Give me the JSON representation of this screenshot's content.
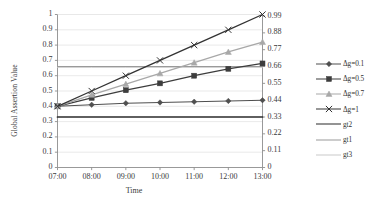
{
  "chart_data": {
    "type": "line",
    "title": "",
    "xlabel": "Time",
    "ylabel": "Global Assertion Value",
    "x": [
      "07:00",
      "08:00",
      "09:00",
      "10:00",
      "11:00",
      "12:00",
      "13:00"
    ],
    "xtick_labels": [
      "07:00",
      "08:00",
      "09:00",
      "10:00",
      "11:00",
      "12:00",
      "13:00"
    ],
    "ylim": [
      0,
      1
    ],
    "ytick_labels": [
      "0",
      "0.1",
      "0.2",
      "0.3",
      "0.4",
      "0.5",
      "0.6",
      "0.7",
      "0.8",
      "0.9",
      "1"
    ],
    "ytick_values": [
      0,
      0.1,
      0.2,
      0.3,
      0.4,
      0.5,
      0.6,
      0.7,
      0.8,
      0.9,
      1
    ],
    "y2lim": [
      0,
      1
    ],
    "y2tick_labels": [
      "0",
      "0.11",
      "0.22",
      "0.33",
      "0.44",
      "0.55",
      "0.66",
      "0.77",
      "0.88",
      "0.99"
    ],
    "y2tick_values": [
      0,
      0.11,
      0.22,
      0.33,
      0.44,
      0.55,
      0.66,
      0.77,
      0.88,
      0.99
    ],
    "grid": true,
    "grid_axis": "y",
    "legend_position": "right",
    "series": [
      {
        "name": "Δg=0.1",
        "marker": "diamond",
        "color": "#4f4f4f",
        "width": 1.1,
        "values": [
          0.4,
          0.41,
          0.42,
          0.425,
          0.43,
          0.435,
          0.44
        ]
      },
      {
        "name": "Δg=0.5",
        "marker": "square",
        "color": "#3d3d3d",
        "width": 1.3,
        "values": [
          0.4,
          0.455,
          0.505,
          0.55,
          0.6,
          0.645,
          0.68
        ]
      },
      {
        "name": "Δg=0.7",
        "marker": "triangle",
        "color": "#a8a8a8",
        "width": 1.3,
        "values": [
          0.4,
          0.475,
          0.545,
          0.615,
          0.685,
          0.755,
          0.82
        ]
      },
      {
        "name": "Δg=1",
        "marker": "cross",
        "color": "#333333",
        "width": 1.3,
        "values": [
          0.4,
          0.5,
          0.6,
          0.7,
          0.8,
          0.9,
          1.0
        ]
      },
      {
        "name": "gt2",
        "marker": "none",
        "color": "#2b2b2b",
        "width": 1.7,
        "values": [
          0.33,
          0.33,
          0.33,
          0.33,
          0.33,
          0.33,
          0.33
        ]
      },
      {
        "name": "gt1",
        "marker": "none",
        "color": "#9a9a9a",
        "width": 1.1,
        "values": [
          0.66,
          0.66,
          0.66,
          0.66,
          0.66,
          0.66,
          0.66
        ]
      },
      {
        "name": "gt3",
        "marker": "none",
        "color": "#c9c9c9",
        "width": 1.0,
        "values": [
          0.655,
          0.655,
          0.655,
          0.655,
          0.655,
          0.655,
          0.655
        ]
      }
    ]
  },
  "legend": {
    "items": [
      {
        "label": "Δg=0.1"
      },
      {
        "label": "Δg=0.5"
      },
      {
        "label": "Δg=0.7"
      },
      {
        "label": "Δg=1"
      },
      {
        "label": "gt2"
      },
      {
        "label": "gt1"
      },
      {
        "label": "gt3"
      }
    ]
  }
}
